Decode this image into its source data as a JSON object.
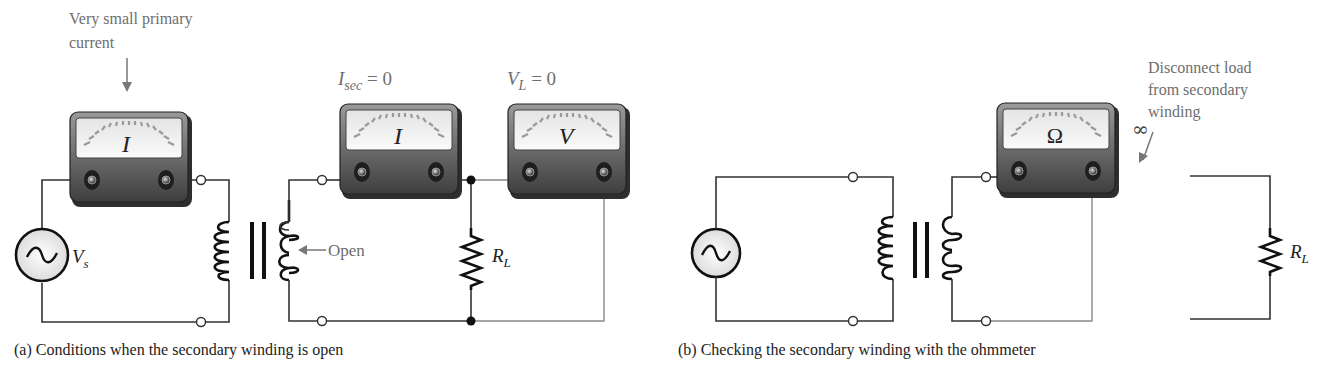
{
  "figure_a": {
    "caption": "(a) Conditions when the secondary winding is open",
    "annotations": {
      "primary_current_note_line1": "Very small primary",
      "primary_current_note_line2": "current",
      "open_note": "Open",
      "isec_main": "I",
      "isec_sub": "sec",
      "isec_value": " = 0",
      "vl_main": "V",
      "vl_sub": "L",
      "vl_value": " = 0"
    },
    "meters": [
      {
        "id": "primary-ammeter",
        "symbol": "I"
      },
      {
        "id": "secondary-ammeter",
        "symbol": "I"
      },
      {
        "id": "load-voltmeter",
        "symbol": "V"
      }
    ],
    "source_label_main": "V",
    "source_label_sub": "s",
    "load_label_main": "R",
    "load_label_sub": "L"
  },
  "figure_b": {
    "caption": "(b) Checking the secondary winding with the ohmmeter",
    "annotations": {
      "disconnect_line1": "Disconnect load",
      "disconnect_line2": "from secondary",
      "disconnect_line3": "winding",
      "infinity": "∞"
    },
    "meters": [
      {
        "id": "ohmmeter",
        "symbol": "Ω"
      }
    ],
    "load_label_main": "R",
    "load_label_sub": "L"
  },
  "colors": {
    "meter_body": "#5a5a5a",
    "meter_face": "#f2f2f2",
    "wire": "#333333",
    "annotation_text": "#6e6e6e"
  }
}
